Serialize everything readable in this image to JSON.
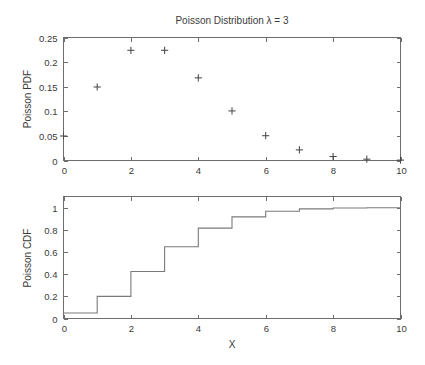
{
  "figure": {
    "title": "Poisson Distribution λ = 3",
    "xlabel": "X"
  },
  "chart_data": [
    {
      "type": "scatter",
      "title": "Poisson Distribution λ = 3",
      "xlabel": "",
      "ylabel": "Poisson PDF",
      "xlim": [
        0,
        10
      ],
      "ylim": [
        0,
        0.25
      ],
      "xticks": [
        0,
        2,
        4,
        6,
        8,
        10
      ],
      "xticklabels": [
        "0",
        "2",
        "4",
        "6",
        "8",
        "10"
      ],
      "yticks": [
        0,
        0.05,
        0.1,
        0.15,
        0.2,
        0.25
      ],
      "yticklabels": [
        "0",
        "0.05",
        "0.1",
        "0.15",
        "0.2",
        "0.25"
      ],
      "grid": false,
      "legend": false,
      "marker": "+",
      "x": [
        0,
        1,
        2,
        3,
        4,
        5,
        6,
        7,
        8,
        9,
        10
      ],
      "values": [
        0.0498,
        0.1494,
        0.224,
        0.224,
        0.168,
        0.1008,
        0.0504,
        0.0216,
        0.0081,
        0.0027,
        0.0008
      ]
    },
    {
      "type": "line",
      "title": "",
      "xlabel": "X",
      "ylabel": "Poisson CDF",
      "xlim": [
        0,
        10
      ],
      "ylim": [
        0,
        1.1
      ],
      "xticks": [
        0,
        2,
        4,
        6,
        8,
        10
      ],
      "xticklabels": [
        "0",
        "2",
        "4",
        "6",
        "8",
        "10"
      ],
      "yticks": [
        0,
        0.2,
        0.4,
        0.6,
        0.8,
        1
      ],
      "yticklabels": [
        "0",
        "0.2",
        "0.4",
        "0.6",
        "0.8",
        "1"
      ],
      "grid": false,
      "legend": false,
      "style": "step",
      "x": [
        0,
        1,
        2,
        3,
        4,
        5,
        6,
        7,
        8,
        9,
        10
      ],
      "values": [
        0.0498,
        0.1991,
        0.4232,
        0.6472,
        0.8153,
        0.9161,
        0.9665,
        0.9881,
        0.9962,
        0.9989,
        0.9997
      ]
    }
  ]
}
